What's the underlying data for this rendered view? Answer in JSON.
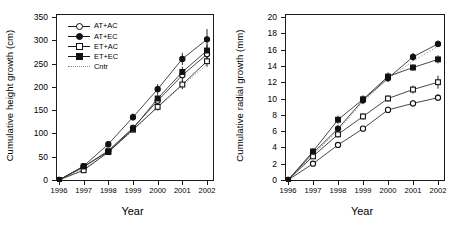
{
  "figure": {
    "panels": [
      "height-growth",
      "radial-growth"
    ]
  },
  "legend": {
    "entries": [
      {
        "label": "AT+AC",
        "marker": "open-circle",
        "line": "solid"
      },
      {
        "label": "AT+EC",
        "marker": "filled-circle",
        "line": "solid"
      },
      {
        "label": "ET+AC",
        "marker": "open-square",
        "line": "solid"
      },
      {
        "label": "ET+EC",
        "marker": "filled-square",
        "line": "solid"
      },
      {
        "label": "Cntr",
        "marker": "none",
        "line": "dotted"
      }
    ]
  },
  "chart_data": [
    {
      "type": "line",
      "title": "",
      "xlabel": "Year",
      "ylabel": "Cumulative height growth (cm)",
      "categories": [
        "1996",
        "1997",
        "1998",
        "1999",
        "2000",
        "2001",
        "2002"
      ],
      "x": [
        1996,
        1997,
        1998,
        1999,
        2000,
        2001,
        2002
      ],
      "xlim": [
        1996,
        2002
      ],
      "ylim": [
        0,
        350
      ],
      "yticks": [
        0,
        50,
        100,
        150,
        200,
        250,
        300,
        350
      ],
      "xticks": [
        1996,
        1997,
        1998,
        1999,
        2000,
        2001,
        2002
      ],
      "grid": false,
      "legend_position": "upper-left",
      "series": [
        {
          "name": "AT+AC",
          "marker": "open-circle",
          "values": [
            0,
            28,
            63,
            112,
            170,
            225,
            270
          ],
          "errors": [
            0,
            4,
            5,
            7,
            9,
            12,
            14
          ]
        },
        {
          "name": "AT+EC",
          "marker": "filled-circle",
          "values": [
            0,
            30,
            77,
            135,
            195,
            260,
            302
          ],
          "errors": [
            0,
            5,
            6,
            8,
            11,
            13,
            22
          ]
        },
        {
          "name": "ET+AC",
          "marker": "open-square",
          "values": [
            0,
            21,
            60,
            108,
            157,
            205,
            255
          ],
          "errors": [
            0,
            3,
            5,
            6,
            8,
            10,
            12
          ]
        },
        {
          "name": "ET+EC",
          "marker": "filled-square",
          "values": [
            0,
            29,
            61,
            110,
            175,
            232,
            278
          ],
          "errors": [
            0,
            4,
            5,
            7,
            9,
            11,
            13
          ]
        },
        {
          "name": "Cntr",
          "marker": "none",
          "values": [
            0,
            24,
            59,
            107,
            156,
            203,
            248
          ],
          "errors": [
            0,
            0,
            0,
            0,
            0,
            0,
            0
          ]
        }
      ]
    },
    {
      "type": "line",
      "title": "",
      "xlabel": "Year",
      "ylabel": "Cumulative radial growth (mm)",
      "categories": [
        "1996",
        "1997",
        "1998",
        "1999",
        "2000",
        "2001",
        "2002"
      ],
      "x": [
        1996,
        1997,
        1998,
        1999,
        2000,
        2001,
        2002
      ],
      "xlim": [
        1996,
        2002
      ],
      "ylim": [
        0,
        20
      ],
      "yticks": [
        0,
        2,
        4,
        6,
        8,
        10,
        12,
        14,
        16,
        18,
        20
      ],
      "xticks": [
        1996,
        1997,
        1998,
        1999,
        2000,
        2001,
        2002
      ],
      "grid": false,
      "legend_position": "none",
      "series": [
        {
          "name": "AT+AC",
          "marker": "open-circle",
          "values": [
            0,
            2.0,
            4.3,
            6.3,
            8.6,
            9.4,
            10.1
          ],
          "errors": [
            0,
            0.2,
            0.3,
            0.3,
            0.4,
            0.4,
            0.4
          ]
        },
        {
          "name": "AT+EC",
          "marker": "filled-circle",
          "values": [
            0,
            3.3,
            6.3,
            9.8,
            12.5,
            15.1,
            16.7
          ],
          "errors": [
            0,
            0.4,
            0.4,
            0.5,
            0.5,
            0.5,
            0.4
          ]
        },
        {
          "name": "ET+AC",
          "marker": "open-square",
          "values": [
            0,
            2.9,
            5.6,
            7.8,
            10.0,
            11.1,
            12.0
          ],
          "errors": [
            0,
            0.3,
            0.4,
            0.4,
            0.4,
            0.5,
            0.8
          ]
        },
        {
          "name": "ET+EC",
          "marker": "filled-square",
          "values": [
            0,
            3.5,
            7.4,
            9.9,
            12.7,
            13.8,
            14.8
          ],
          "errors": [
            0,
            0.4,
            0.5,
            0.5,
            0.5,
            0.4,
            0.5
          ]
        },
        {
          "name": "Cntr",
          "marker": "none",
          "values": [
            0,
            3.1,
            6.1,
            9.6,
            12.4,
            14.6,
            16.4
          ],
          "errors": [
            0,
            0,
            0,
            0,
            0,
            0,
            0
          ]
        }
      ]
    }
  ]
}
